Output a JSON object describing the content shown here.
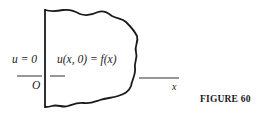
{
  "figure": {
    "caption": "FIGURE 60",
    "labels": {
      "boundary_condition": "u = 0",
      "initial_condition": "u(x, 0) = f(x)",
      "origin": "O",
      "x_axis": "x"
    },
    "colors": {
      "stroke": "#1a1a1a",
      "background": "#ffffff"
    }
  }
}
